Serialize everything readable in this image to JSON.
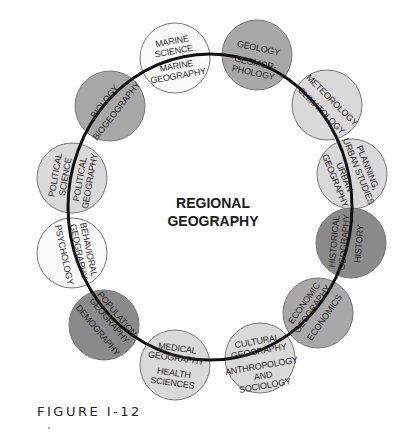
{
  "center": {
    "lines": [
      "REGIONAL",
      "GEOGRAPHY"
    ]
  },
  "caption": "FIGURE I-12",
  "colors": {
    "white": "#fafafa",
    "light": "#d9d9d9",
    "medium": "#a8a8a8",
    "dark": "#8a8a8a",
    "ring": "#111111",
    "stroke": "#777777"
  },
  "nodes": [
    {
      "id": "marine",
      "shade": "white",
      "outer": [
        "MARINE",
        "SCIENCE"
      ],
      "inner": [
        "MARINE",
        "GEOGRAPHY"
      ]
    },
    {
      "id": "geology",
      "shade": "medium",
      "outer": [
        "GEOLOGY"
      ],
      "inner": [
        "GEOMOR-",
        "PHOLOGY"
      ]
    },
    {
      "id": "meteorology",
      "shade": "light",
      "outer": [
        "METEOROLOGY"
      ],
      "inner": [
        "CLIMATOLOGY"
      ]
    },
    {
      "id": "planning",
      "shade": "light",
      "outer": [
        "PLANNING,",
        "URBAN STUDIES"
      ],
      "inner": [
        "URBAN",
        "GEOGRAPHY"
      ]
    },
    {
      "id": "history",
      "shade": "dark",
      "outer": [
        "HISTORY"
      ],
      "inner": [
        "HISTORICAL",
        "GEOGRAPHY"
      ]
    },
    {
      "id": "economics",
      "shade": "medium",
      "outer": [
        "ECONOMICS"
      ],
      "inner": [
        "ECONOMIC",
        "GEOGRAPHY"
      ]
    },
    {
      "id": "anthropology",
      "shade": "light",
      "outer": [
        "ANTHROPOLOGY",
        "AND",
        "SOCIOLOGY"
      ],
      "inner": [
        "CULTURAL",
        "GEOGRAPHY"
      ]
    },
    {
      "id": "health",
      "shade": "light",
      "outer": [
        "HEALTH",
        "SCIENCES"
      ],
      "inner": [
        "MEDICAL",
        "GEOGRAPHY"
      ]
    },
    {
      "id": "demography",
      "shade": "dark",
      "outer": [
        "DEMOGRAPHY"
      ],
      "inner": [
        "POPULATION",
        "GEOGRAPHY"
      ]
    },
    {
      "id": "psychology",
      "shade": "white",
      "outer": [
        "PSYCHOLOGY"
      ],
      "inner": [
        "BEHAVIORAL",
        "GEOGRAPHY"
      ]
    },
    {
      "id": "political",
      "shade": "light",
      "outer": [
        "POLITICAL",
        "SCIENCE"
      ],
      "inner": [
        "POLITICAL",
        "GEOGRAPHY"
      ]
    },
    {
      "id": "biology",
      "shade": "medium",
      "outer": [
        "BIOLOGY"
      ],
      "inner": [
        "BIOGEOGRAPHY"
      ]
    }
  ]
}
